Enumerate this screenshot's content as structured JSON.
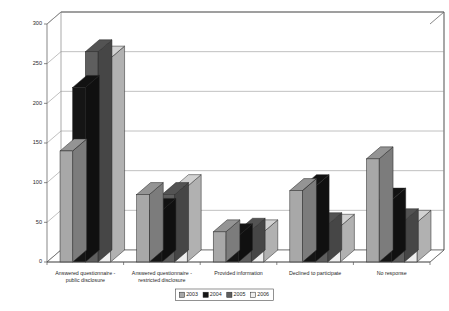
{
  "chart_data": {
    "type": "bar",
    "title": "",
    "subtitle": "",
    "xlabel": "",
    "ylabel": "",
    "ylim": [
      0,
      300
    ],
    "ytick_step": 50,
    "yticks": [
      0,
      50,
      100,
      150,
      200,
      250,
      300
    ],
    "grid": true,
    "grid_axis": "y",
    "legend_position": "bottom",
    "three_d": true,
    "categories": [
      "Answered questionnaire - public disclosure",
      "Answered questionnaire - restricted disclosure",
      "Provided information",
      "Declined to participate",
      "No response"
    ],
    "category_lines": [
      [
        "Answered questionnaire -",
        "public disclosure"
      ],
      [
        "Answered questionnaire -",
        "restricted disclosure"
      ],
      [
        "Provided information"
      ],
      [
        "Declined to participate"
      ],
      [
        "No response"
      ]
    ],
    "series": [
      {
        "name": "2003",
        "color": "#a8a8a8",
        "values": [
          140,
          85,
          38,
          90,
          130
        ]
      },
      {
        "name": "2004",
        "color": "#151515",
        "values": [
          220,
          65,
          33,
          95,
          78
        ]
      },
      {
        "name": "2005",
        "color": "#5e5e5e",
        "values": [
          265,
          85,
          40,
          47,
          52
        ]
      },
      {
        "name": "2006",
        "color": "#efefef",
        "values": [
          257,
          95,
          38,
          45,
          50
        ]
      }
    ]
  },
  "legend": {
    "entries": [
      "2003",
      "2004",
      "2005",
      "2006"
    ]
  },
  "axis": {
    "y_tick_labels": [
      "300",
      "250",
      "200",
      "150",
      "100",
      "50",
      "0"
    ]
  },
  "colors": {
    "series_2003": "#a8a8a8",
    "series_2004": "#151515",
    "series_2005": "#5e5e5e",
    "series_2006": "#efefef",
    "gridline": "#8c8c8c",
    "axis": "#555555",
    "background": "#ffffff",
    "text": "#1f1f1f"
  }
}
